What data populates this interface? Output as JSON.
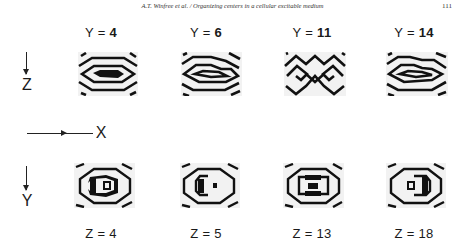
{
  "header": {
    "running_title": "A.T. Winfree et al. / Organizing centers in a cellular excitable medium",
    "page_number": "111"
  },
  "figure": {
    "axes": {
      "z_label": "Z",
      "x_label": "X",
      "y_label": "Y"
    },
    "top_row": {
      "description": "XZ cross-sections at fixed Y",
      "panels": [
        {
          "label": "Y = 4",
          "prefix": "Y =",
          "value": "4",
          "pattern": "concentric-lens"
        },
        {
          "label": "Y = 6",
          "prefix": "Y =",
          "value": "6",
          "pattern": "nested-chevrons"
        },
        {
          "label": "Y = 11",
          "prefix": "Y =",
          "value": "11",
          "pattern": "interlocked-spirals"
        },
        {
          "label": "Y = 14",
          "prefix": "Y =",
          "value": "14",
          "pattern": "nested-chevrons-reversed"
        }
      ]
    },
    "bottom_row": {
      "description": "XY cross-sections at fixed Z",
      "panels": [
        {
          "label": "Z = 4",
          "prefix": "Z =",
          "value": "4",
          "pattern": "ring-left-bracket"
        },
        {
          "label": "Z = 5",
          "prefix": "Z =",
          "value": "5",
          "pattern": "ring-left-c"
        },
        {
          "label": "Z = 13",
          "prefix": "Z =",
          "value": "13",
          "pattern": "ring-center-bar"
        },
        {
          "label": "Z = 18",
          "prefix": "Z =",
          "value": "18",
          "pattern": "ring-right-bracket"
        }
      ]
    },
    "colors": {
      "ink": "#111111",
      "panel_bg": "#f2f2f2",
      "page_bg": "#ffffff"
    }
  }
}
